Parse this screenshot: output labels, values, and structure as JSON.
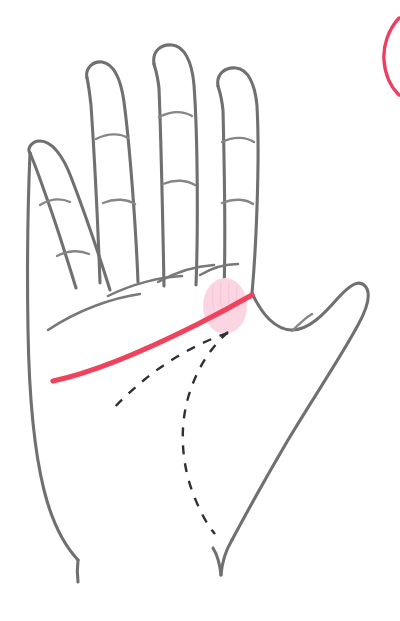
{
  "canvas": {
    "width": 400,
    "height": 621,
    "background": "#ffffff",
    "title": "Palm reading diagram - heart line highlighted"
  },
  "colors": {
    "outline": "#6f7072",
    "crease": "#77787a",
    "dashed": "#2f3032",
    "heart_line": "#f1425d",
    "highlight_fill": "#fbd6e2",
    "corner_arc": "#ec3f63"
  },
  "illustration": {
    "subject": "open-left-palm",
    "parts": [
      {
        "name": "pinky-finger",
        "label": "Pinky"
      },
      {
        "name": "ring-finger",
        "label": "Ring finger"
      },
      {
        "name": "middle-finger",
        "label": "Middle finger"
      },
      {
        "name": "index-finger",
        "label": "Index finger"
      },
      {
        "name": "thumb",
        "label": "Thumb"
      },
      {
        "name": "palm",
        "label": "Palm"
      },
      {
        "name": "wrist",
        "label": "Wrist"
      }
    ],
    "marked_lines": [
      {
        "name": "heart-line",
        "label": "Heart line",
        "style": "solid",
        "color": "#f1425d",
        "emphasis": "highlighted"
      },
      {
        "name": "head-line",
        "label": "Head line",
        "style": "dashed",
        "color": "#2f3032",
        "emphasis": "reference"
      },
      {
        "name": "life-line",
        "label": "Life line",
        "style": "dashed",
        "color": "#2f3032",
        "emphasis": "reference"
      }
    ],
    "highlight": {
      "name": "heart-line-origin-highlight",
      "label": "Highlighted region at start of heart line",
      "shape": "ellipse",
      "center_x": 225,
      "center_y": 306,
      "radius_x": 22,
      "radius_y": 28,
      "color": "#fbd6e2"
    },
    "corner_marker": {
      "name": "top-right-circle-fragment",
      "label": "Partially visible pink circle outline",
      "color": "#ec3f63",
      "position": "top-right-edge"
    }
  },
  "geometry": {
    "pinky": {
      "outer": "M 30 153 C 27 149 31 141 40 141 C 52 141 63 156 71 177 C 86 216 100 258 110 290",
      "inner": "M 76 288 C 68 262 57 226 46 196 C 38 173 33 160 30 153",
      "creases": [
        "M 40 205 C 50 199 61 198 70 202",
        "M 57 256 C 68 250 80 250 89 254"
      ]
    },
    "ring": {
      "outer": "M 87 78 C 85 68 93 61 102 62 C 114 64 121 80 124 102 C 130 147 136 230 138 282",
      "inner": "M 100 283 C 98 228 94 149 91 105 C 89 88 88 82 87 78",
      "creases": [
        "M 96 139 C 108 133 120 133 128 138",
        "M 103 203 C 115 198 127 199 135 204"
      ]
    },
    "middle": {
      "outer": "M 154 64 C 152 51 161 44 172 45 C 184 46 192 61 194 85 C 198 140 198 235 196 285",
      "inner": "M 164 286 C 163 232 161 140 159 88 C 157 72 155 68 154 64",
      "creases": [
        "M 159 117 C 171 111 183 111 192 116",
        "M 163 184 C 175 179 187 180 195 185"
      ]
    },
    "index": {
      "outer": "M 218 86 C 216 74 225 67 236 68 C 248 69 255 84 257 106 C 260 160 256 250 252 293",
      "inner": "M 224 289 C 226 234 224 152 223 110 C 221 93 219 90 218 86",
      "creases": [
        "M 222 142 C 234 136 246 137 254 142",
        "M 222 203 C 234 198 246 199 253 204"
      ]
    },
    "thumb": {
      "outer": "M 252 293 C 262 315 276 330 292 330 C 309 330 324 314 338 298 C 350 285 358 280 364 285 C 371 291 369 305 358 325 C 342 355 312 400 288 440 C 268 474 248 510 232 540",
      "inner": "M 292 333 C 297 325 302 318 309 314",
      "crease": "M 292 331 C 299 324 305 318 312 314"
    },
    "palm_left": "M 30 153 C 28 200 27 270 28 330 C 29 392 34 450 44 490 C 52 522 64 545 78 560",
    "palm_right_lower": "M 232 540 C 226 550 222 562 221 575",
    "wrist_left": "M 78 560 C 77 568 77 574 78 582",
    "wrist_right": "M 221 575 C 220 565 218 556 213 548",
    "palm_base_creases": [
      "M 48 330 C 78 310 112 298 140 294",
      "M 108 296 C 132 284 160 277 182 276",
      "M 158 282 C 176 272 196 266 214 265",
      "M 200 275 C 212 268 226 264 238 264"
    ],
    "heart_line": "M 53 381 C 96 372 150 348 196 325 C 218 314 238 303 252 295",
    "head_line": "M 228 333 C 200 342 168 360 144 380 C 130 392 120 401 113 409",
    "life_line": "M 228 332 C 210 348 196 370 188 398 C 179 430 182 466 194 496 C 202 516 209 527 215 534",
    "corner_arc": "M 399 18 C 388 30 383 46 384 60 C 385 76 391 87 399 95"
  }
}
